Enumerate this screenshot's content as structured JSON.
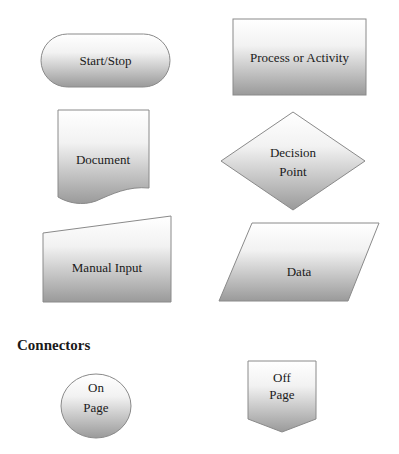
{
  "colors": {
    "gradient_top": "#ffffff",
    "gradient_bottom": "#9c9c9c",
    "stroke": "#8a8a8a",
    "text": "#1a1a1a"
  },
  "shapes": {
    "start_stop": {
      "label": "Start/Stop",
      "type": "terminator"
    },
    "process": {
      "label": "Process or Activity",
      "type": "rectangle"
    },
    "document": {
      "label": "Document",
      "type": "document"
    },
    "decision": {
      "line1": "Decision",
      "line2": "Point",
      "type": "diamond"
    },
    "manual_input": {
      "label": "Manual Input",
      "type": "manual-input"
    },
    "data": {
      "label": "Data",
      "type": "parallelogram"
    }
  },
  "connectors": {
    "heading": "Connectors",
    "on_page": {
      "line1": "On",
      "line2": "Page",
      "type": "circle"
    },
    "off_page": {
      "line1": "Off",
      "line2": "Page",
      "type": "pentagon"
    }
  }
}
